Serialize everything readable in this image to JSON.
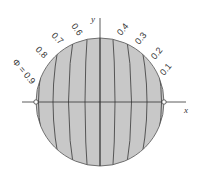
{
  "diagram": {
    "title": "",
    "axes": {
      "x_label": "x",
      "y_label": "y"
    },
    "circle": {
      "cx": 100,
      "cy": 102,
      "r": 64,
      "fill": "#c8c8c8",
      "stroke": "#666666"
    },
    "potential_symbol": "Φ = ",
    "contour_labels": [
      "0.9",
      "0.8",
      "0.7",
      "0.6",
      "0.4",
      "0.3",
      "0.2",
      "0.1"
    ],
    "label_first": "Φ = 0.9",
    "colors": {
      "line": "#555555",
      "axis": "#333333",
      "text": "#333333",
      "fill": "#c8c8c8"
    }
  }
}
